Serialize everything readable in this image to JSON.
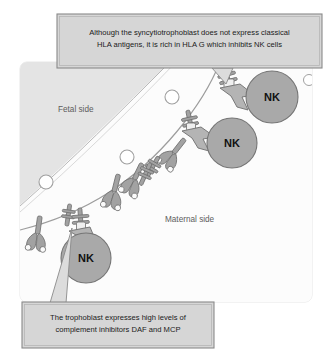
{
  "figure": {
    "panel": {
      "fetal_label": "Fetal side",
      "maternal_label": "Maternal side",
      "fetal_fill": "#e3e3e3",
      "maternal_fill": "#fcfcfc",
      "panel_fill": "#f7f7f7",
      "panel_border": "#e0e0e0"
    },
    "captions": {
      "top": {
        "line1": "Although the syncytiotrophoblast does not express classical",
        "line2": "HLA antigens, it is rich in HLA G which inhibits NK cells",
        "fill": "#d6d6d6",
        "border": "#8a8a8a"
      },
      "bottom": {
        "line1": "The trophoblast expresses high levels of",
        "line2": "complement inhibitors DAF and MCP",
        "fill": "#d6d6d6",
        "border": "#8a8a8a"
      }
    },
    "nk_cells": [
      {
        "label": "NK",
        "cx": 272,
        "cy": 97,
        "r": 26
      },
      {
        "label": "NK",
        "cx": 232,
        "cy": 143,
        "r": 25
      },
      {
        "label": "NK",
        "cx": 86,
        "cy": 258,
        "r": 25
      }
    ],
    "nk_cell_fill": "#a9a9a9",
    "nk_cell_border": "#6f6f6f",
    "molecule_color": "#9a9a9a",
    "molecule_border": "#6a6a6a",
    "vesicle_fill": "#ffffff",
    "vesicle_border": "#9b9b9b",
    "vesicles": [
      {
        "cx": 172,
        "cy": 97,
        "r": 7
      },
      {
        "cx": 127,
        "cy": 157,
        "r": 7
      },
      {
        "cx": 46,
        "cy": 182,
        "r": 7
      },
      {
        "cx": 311,
        "cy": 80,
        "r": 6
      }
    ]
  }
}
